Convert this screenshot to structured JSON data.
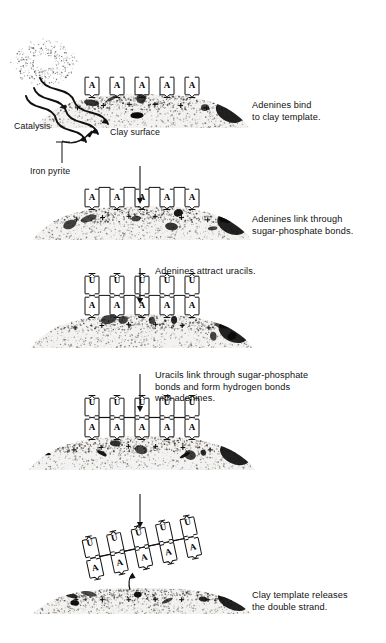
{
  "diagram": {
    "type": "process-flow",
    "background": "#ffffff",
    "ink": "#111111"
  },
  "annotations": {
    "catalysis": "Catalysis",
    "clay_surface": "Clay surface",
    "iron_pyrite": "Iron pyrite"
  },
  "nucleotides": {
    "adenine": "A",
    "uracil": "U",
    "charge": "+"
  },
  "steps": [
    {
      "id": "step-1",
      "caption": "Adenines bind\nto clay template.",
      "caption_x": 252,
      "caption_y": 100,
      "bed_y": 128,
      "bed_style": "mound",
      "adenines": 5,
      "uracils": 0,
      "adenine_linked": false,
      "uracil_linked": false
    },
    {
      "id": "step-2",
      "caption": "Adenines link through\nsugar-phosphate bonds.",
      "caption_x": 252,
      "caption_y": 214,
      "bed_y": 240,
      "bed_style": "mound",
      "adenines": 5,
      "uracils": 0,
      "adenine_linked": true,
      "uracil_linked": false
    },
    {
      "id": "step-3",
      "caption": "Adenines attract uracils.",
      "caption_x": 155,
      "caption_y": 266,
      "bed_y": 348,
      "bed_style": "mound",
      "adenines": 5,
      "uracils": 5,
      "adenine_linked": true,
      "uracil_linked": false
    },
    {
      "id": "step-4",
      "caption": "Uracils link through sugar-phosphate\nbonds and form hydrogen bonds\nwith adenines.",
      "caption_x": 155,
      "caption_y": 370,
      "bed_y": 470,
      "bed_style": "mound",
      "adenines": 5,
      "uracils": 5,
      "adenine_linked": true,
      "uracil_linked": true
    },
    {
      "id": "step-5",
      "caption": "Clay template releases\nthe double strand.",
      "caption_x": 252,
      "caption_y": 590,
      "bed_y": 614,
      "bed_style": "flat",
      "adenines": 5,
      "uracils": 5,
      "adenine_linked": true,
      "uracil_linked": true,
      "released": true,
      "tilt_deg": -12
    }
  ],
  "flow_arrows": [
    {
      "id": "arrow-1-2",
      "x": 140,
      "y1": 166,
      "y2": 204
    },
    {
      "id": "arrow-2-3",
      "x": 140,
      "y1": 268,
      "y2": 304
    },
    {
      "id": "arrow-3-4",
      "x": 140,
      "y1": 374,
      "y2": 412
    },
    {
      "id": "arrow-4-5",
      "x": 140,
      "y1": 494,
      "y2": 528
    }
  ],
  "energy_source": {
    "name": "energy-source",
    "x": 44,
    "y": 62,
    "ray_count": 3,
    "description": "stippled energy burst emitting wavy arrows toward clay"
  },
  "release_arrow": {
    "id": "release-arrow",
    "x": 128,
    "y": 584
  }
}
